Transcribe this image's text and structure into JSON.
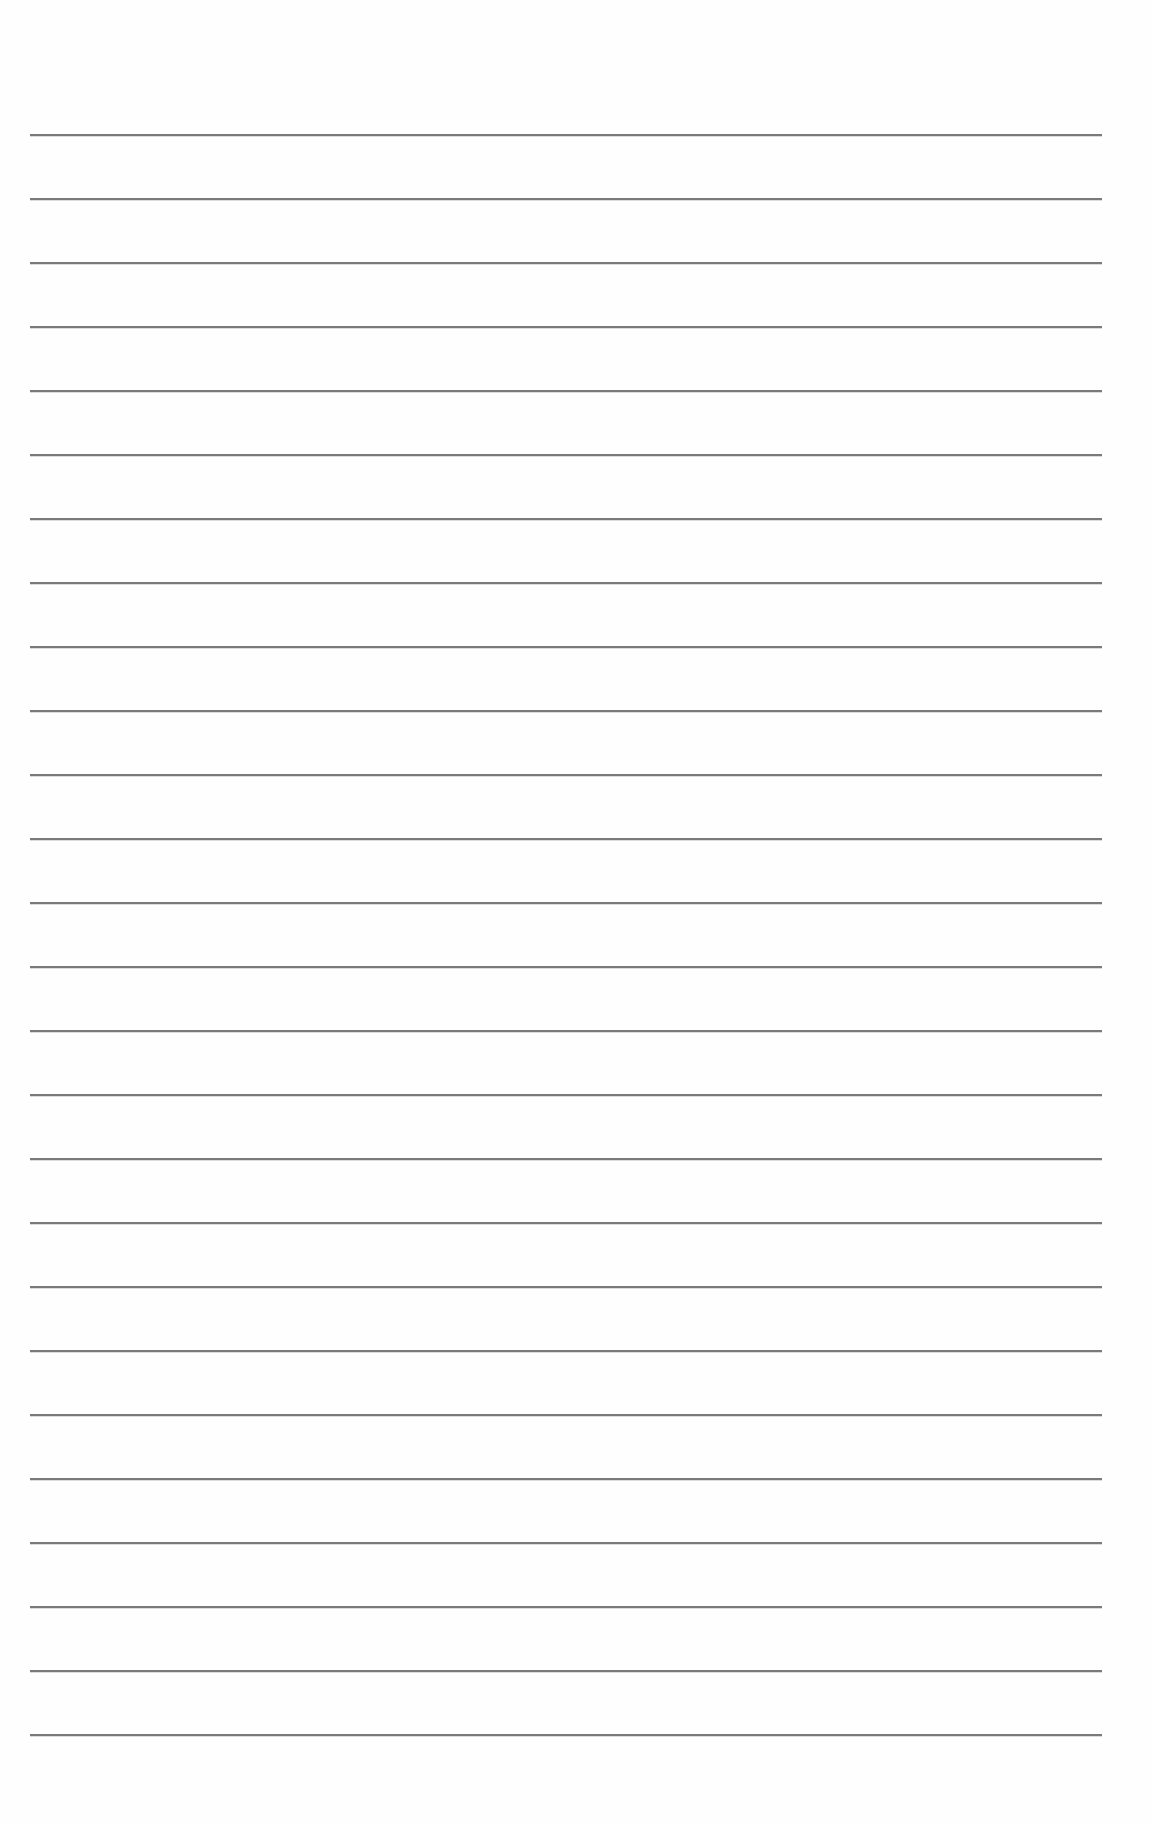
{
  "page": {
    "type": "lined-paper",
    "background_color": "#fefefe",
    "rule_color": "#7a7a7a",
    "rule_count": 26,
    "first_rule_y": 134,
    "rule_spacing": 64,
    "rule_left": 30,
    "rule_width": 1072,
    "text": ""
  }
}
